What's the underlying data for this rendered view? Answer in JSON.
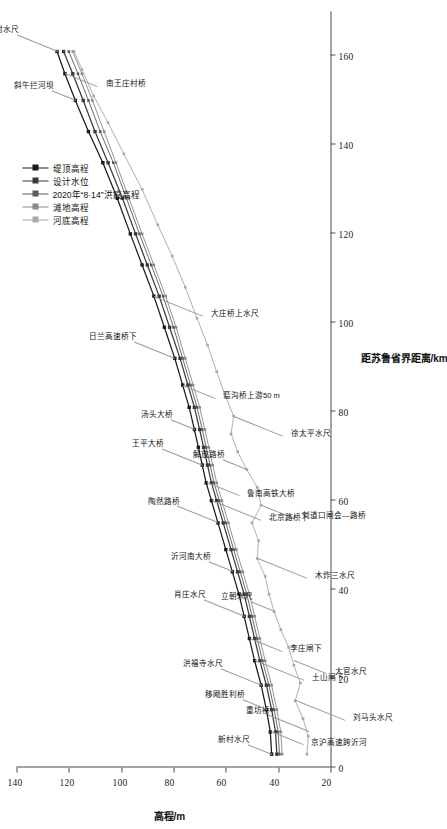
{
  "chart_data": {
    "type": "line",
    "title": "",
    "xlabel": "距苏鲁省界距离/km",
    "ylabel": "高程/m",
    "xlim": [
      0,
      170
    ],
    "ylim": [
      20,
      140
    ],
    "xticks": [
      0,
      20,
      40,
      60,
      80,
      100,
      120,
      140,
      160
    ],
    "yticks": [
      20,
      40,
      60,
      80,
      100,
      120,
      140
    ],
    "grid": false,
    "legend_position": "top-right",
    "series": [
      {
        "name": "堤顶高程",
        "color": "#1a1a1a",
        "marker": "square",
        "x": [
          3.0,
          8.0,
          13.0,
          18.5,
          24.0,
          29.0,
          34.0,
          39.0,
          44.0,
          49.0,
          55.0,
          60.0,
          64.0,
          68.0,
          72.0,
          76.0,
          81.0,
          86.0,
          92.0,
          99.0,
          106.0,
          113.0,
          120.0,
          128.0,
          136.0,
          143.0,
          150.0,
          156.0,
          161.0
        ],
        "values": [
          42.5,
          43.0,
          44.5,
          46.5,
          49.0,
          51.0,
          53.0,
          55.0,
          57.5,
          60.0,
          63.0,
          65.5,
          67.5,
          69.0,
          70.5,
          72.0,
          74.0,
          76.5,
          79.5,
          83.5,
          87.5,
          92.0,
          96.5,
          101.5,
          107.0,
          112.5,
          117.5,
          121.5,
          124.5
        ]
      },
      {
        "name": "设计水位",
        "color": "#3a3a3a",
        "marker": "square",
        "x": [
          3.0,
          8.0,
          13.0,
          18.5,
          24.0,
          29.0,
          34.0,
          39.0,
          44.0,
          49.0,
          55.0,
          60.0,
          64.0,
          68.0,
          72.0,
          76.0,
          81.0,
          86.0,
          92.0,
          99.0,
          106.0,
          113.0,
          120.0,
          128.0,
          136.0,
          143.0,
          150.0,
          156.0,
          161.0
        ],
        "values": [
          40.5,
          41.0,
          42.5,
          44.5,
          47.0,
          49.0,
          51.0,
          53.0,
          55.5,
          58.0,
          61.0,
          63.5,
          65.5,
          67.0,
          68.5,
          70.0,
          72.0,
          74.5,
          77.5,
          81.5,
          85.5,
          90.0,
          94.5,
          99.5,
          105.0,
          110.0,
          114.5,
          118.5,
          122.0
        ]
      },
      {
        "name": "2020年“8·14”洪痕高程",
        "color": "#5a5a5a",
        "marker": "square",
        "x": [
          3.0,
          8.0,
          13.0,
          18.5,
          24.0,
          29.0,
          34.0,
          39.0,
          44.0,
          49.0,
          55.0,
          60.0,
          64.0,
          68.0,
          72.0,
          76.0,
          81.0,
          86.0,
          92.0,
          99.0,
          106.0,
          113.0,
          120.0,
          128.0,
          136.0,
          143.0,
          150.0,
          156.0,
          161.0
        ],
        "values": [
          39.5,
          40.0,
          41.5,
          43.5,
          46.0,
          48.0,
          50.0,
          52.0,
          54.5,
          57.0,
          60.0,
          62.5,
          64.5,
          66.0,
          67.5,
          69.0,
          71.0,
          73.5,
          76.5,
          80.0,
          84.0,
          88.5,
          93.0,
          98.0,
          103.0,
          108.0,
          112.5,
          116.5,
          120.0
        ]
      },
      {
        "name": "滩地高程",
        "color": "#8a8a8a",
        "marker": "square",
        "x": [
          3.0,
          8.0,
          13.0,
          18.5,
          24.0,
          29.0,
          34.0,
          39.0,
          44.0,
          49.0,
          55.0,
          60.0,
          64.0,
          68.0,
          72.0,
          76.0,
          81.0,
          86.0,
          92.0,
          99.0,
          106.0,
          113.0,
          120.0,
          128.0,
          136.0,
          143.0,
          150.0,
          156.0,
          161.0
        ],
        "values": [
          38.5,
          39.0,
          40.5,
          42.5,
          45.0,
          47.0,
          49.0,
          51.0,
          53.5,
          56.0,
          59.0,
          61.5,
          63.5,
          65.0,
          66.5,
          68.0,
          70.0,
          72.5,
          75.5,
          79.0,
          83.0,
          87.5,
          92.0,
          97.0,
          102.0,
          106.5,
          111.0,
          115.0,
          118.5
        ]
      },
      {
        "name": "河底高程",
        "color": "#a8a8a8",
        "marker": "square",
        "x": [
          3.0,
          7.0,
          11.0,
          15.0,
          19.0,
          23.0,
          27.0,
          31.0,
          35.0,
          39.0,
          43.0,
          47.0,
          51.0,
          55.0,
          59.0,
          63.0,
          67.0,
          71.0,
          75.0,
          79.0,
          84.0,
          89.0,
          95.0,
          101.0,
          108.0,
          115.0,
          122.0,
          130.0,
          138.0,
          145.0,
          151.0,
          157.0,
          161.0
        ],
        "values": [
          29.0,
          28.5,
          30.5,
          33.5,
          31.5,
          34.0,
          36.0,
          39.0,
          41.5,
          43.5,
          45.0,
          48.0,
          47.5,
          50.0,
          46.5,
          48.0,
          52.0,
          55.5,
          58.0,
          57.0,
          60.5,
          63.5,
          67.0,
          71.0,
          75.5,
          80.5,
          86.0,
          92.0,
          99.0,
          105.0,
          110.5,
          115.0,
          118.0
        ]
      }
    ],
    "annotations": [
      {
        "label": "新村水尺",
        "x": 3.0,
        "y": 42.5
      },
      {
        "label": "京沪高速跨沂河",
        "x": 8.0,
        "y": 43.0
      },
      {
        "label": "重坊桥",
        "x": 8.0,
        "y": 28.5
      },
      {
        "label": "刘马头水尺",
        "x": 15.0,
        "y": 33.5
      },
      {
        "label": "移飏胜利桥",
        "x": 13.0,
        "y": 44.5
      },
      {
        "label": "大官水尺",
        "x": 24.0,
        "y": 34.0
      },
      {
        "label": "洪福寺水尺",
        "x": 18.5,
        "y": 46.5
      },
      {
        "label": "土山闸下",
        "x": 24.0,
        "y": 49.0
      },
      {
        "label": "立朝水尺",
        "x": 35.0,
        "y": 41.5
      },
      {
        "label": "李庄闸下",
        "x": 29.0,
        "y": 51.0
      },
      {
        "label": "肖庄水尺",
        "x": 34.0,
        "y": 53.0
      },
      {
        "label": "木炸三水尺",
        "x": 47.0,
        "y": 48.0
      },
      {
        "label": "沂河南大桥",
        "x": 44.0,
        "y": 57.5
      },
      {
        "label": "刘道口闸会—路桥",
        "x": 59.0,
        "y": 46.5
      },
      {
        "label": "陶然路桥",
        "x": 55.0,
        "y": 63.0
      },
      {
        "label": "北京路桥下",
        "x": 60.0,
        "y": 65.5
      },
      {
        "label": "解放路桥",
        "x": 67.0,
        "y": 52.0
      },
      {
        "label": "鲁南高铁大桥",
        "x": 64.0,
        "y": 67.5
      },
      {
        "label": "王平大桥",
        "x": 68.0,
        "y": 69.0
      },
      {
        "label": "徐太平水尺",
        "x": 79.0,
        "y": 57.0
      },
      {
        "label": "汤头大桥",
        "x": 76.0,
        "y": 72.0
      },
      {
        "label": "葛沟桥上游50 m",
        "x": 86.0,
        "y": 76.5
      },
      {
        "label": "日兰高速桥下",
        "x": 92.0,
        "y": 79.5
      },
      {
        "label": "大庄桥上水尺",
        "x": 106.0,
        "y": 87.5
      },
      {
        "label": "斜午拦河坝",
        "x": 150.0,
        "y": 117.5
      },
      {
        "label": "南王庄村桥",
        "x": 156.0,
        "y": 121.5
      },
      {
        "label": "前臣山村水尺",
        "x": 161.0,
        "y": 124.5
      }
    ]
  },
  "axes": {
    "x_title": "距苏鲁省界距离/km",
    "y_title": "高程/m"
  },
  "legend": {
    "items": [
      {
        "label": "堤顶高程"
      },
      {
        "label": "设计水位"
      },
      {
        "label": "2020年“8·14”洪痕高程"
      },
      {
        "label": "滩地高程"
      },
      {
        "label": "河底高程"
      }
    ]
  }
}
